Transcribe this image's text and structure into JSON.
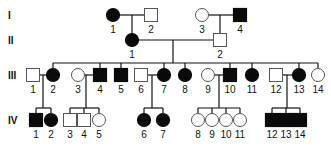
{
  "colors": {
    "affected": "#0a0a0a",
    "unaffected": "#ffffff",
    "line": "#111111"
  },
  "generations": [
    {
      "label": "I",
      "y": 15
    },
    {
      "label": "II",
      "y": 40
    },
    {
      "label": "III",
      "y": 75
    },
    {
      "label": "IV",
      "y": 120
    }
  ],
  "individuals": [
    {
      "id": "I-1",
      "gen": "I",
      "num": "1",
      "sex": "female",
      "affected": true,
      "x": 113,
      "y": 15
    },
    {
      "id": "I-2",
      "gen": "I",
      "num": "2",
      "sex": "male",
      "affected": false,
      "x": 151,
      "y": 15
    },
    {
      "id": "I-3",
      "gen": "I",
      "num": "3",
      "sex": "female",
      "affected": false,
      "x": 202,
      "y": 15
    },
    {
      "id": "I-4",
      "gen": "I",
      "num": "4",
      "sex": "male",
      "affected": true,
      "x": 240,
      "y": 15
    },
    {
      "id": "II-1",
      "gen": "II",
      "num": "1",
      "sex": "female",
      "affected": true,
      "x": 132,
      "y": 40
    },
    {
      "id": "II-2",
      "gen": "II",
      "num": "2",
      "sex": "male",
      "affected": false,
      "x": 220,
      "y": 40
    },
    {
      "id": "III-1",
      "gen": "III",
      "num": "1",
      "sex": "male",
      "affected": false,
      "x": 33,
      "y": 75
    },
    {
      "id": "III-2",
      "gen": "III",
      "num": "2",
      "sex": "female",
      "affected": true,
      "x": 53,
      "y": 75
    },
    {
      "id": "III-3",
      "gen": "III",
      "num": "3",
      "sex": "female",
      "affected": false,
      "x": 78,
      "y": 75
    },
    {
      "id": "III-4",
      "gen": "III",
      "num": "4",
      "sex": "male",
      "affected": true,
      "x": 100,
      "y": 75
    },
    {
      "id": "III-5",
      "gen": "III",
      "num": "5",
      "sex": "male",
      "affected": true,
      "x": 121,
      "y": 75
    },
    {
      "id": "III-6",
      "gen": "III",
      "num": "6",
      "sex": "male",
      "affected": false,
      "x": 141,
      "y": 75
    },
    {
      "id": "III-7",
      "gen": "III",
      "num": "7",
      "sex": "female",
      "affected": true,
      "x": 164,
      "y": 75
    },
    {
      "id": "III-8",
      "gen": "III",
      "num": "8",
      "sex": "female",
      "affected": true,
      "x": 185,
      "y": 75
    },
    {
      "id": "III-9",
      "gen": "III",
      "num": "9",
      "sex": "female",
      "affected": false,
      "x": 208,
      "y": 75
    },
    {
      "id": "III-10",
      "gen": "III",
      "num": "10",
      "sex": "male",
      "affected": true,
      "x": 230,
      "y": 75
    },
    {
      "id": "III-11",
      "gen": "III",
      "num": "11",
      "sex": "female",
      "affected": true,
      "x": 252,
      "y": 75
    },
    {
      "id": "III-12",
      "gen": "III",
      "num": "12",
      "sex": "male",
      "affected": false,
      "x": 276,
      "y": 75
    },
    {
      "id": "III-13",
      "gen": "III",
      "num": "13",
      "sex": "female",
      "affected": true,
      "x": 299,
      "y": 75
    },
    {
      "id": "III-14",
      "gen": "III",
      "num": "14",
      "sex": "female",
      "affected": false,
      "x": 318,
      "y": 75
    },
    {
      "id": "IV-1",
      "gen": "IV",
      "num": "1",
      "sex": "male",
      "affected": true,
      "x": 36,
      "y": 120
    },
    {
      "id": "IV-2",
      "gen": "IV",
      "num": "2",
      "sex": "female",
      "affected": true,
      "x": 51,
      "y": 120
    },
    {
      "id": "IV-3",
      "gen": "IV",
      "num": "3",
      "sex": "male",
      "affected": false,
      "x": 70,
      "y": 120
    },
    {
      "id": "IV-4",
      "gen": "IV",
      "num": "4",
      "sex": "male",
      "affected": false,
      "x": 84,
      "y": 120
    },
    {
      "id": "IV-5",
      "gen": "IV",
      "num": "5",
      "sex": "female",
      "affected": false,
      "x": 99,
      "y": 120
    },
    {
      "id": "IV-6",
      "gen": "IV",
      "num": "6",
      "sex": "female",
      "affected": true,
      "x": 144,
      "y": 120
    },
    {
      "id": "IV-7",
      "gen": "IV",
      "num": "7",
      "sex": "female",
      "affected": true,
      "x": 163,
      "y": 120
    },
    {
      "id": "IV-8",
      "gen": "IV",
      "num": "8",
      "sex": "female",
      "affected": false,
      "x": 198,
      "y": 120
    },
    {
      "id": "IV-9",
      "gen": "IV",
      "num": "9",
      "sex": "female",
      "affected": false,
      "x": 212,
      "y": 120
    },
    {
      "id": "IV-10",
      "gen": "IV",
      "num": "10",
      "sex": "female",
      "affected": false,
      "x": 226,
      "y": 120
    },
    {
      "id": "IV-11",
      "gen": "IV",
      "num": "11",
      "sex": "female",
      "affected": false,
      "x": 240,
      "y": 120
    },
    {
      "id": "IV-12",
      "gen": "IV",
      "num": "12",
      "sex": "male",
      "affected": true,
      "x": 272,
      "y": 120
    },
    {
      "id": "IV-13",
      "gen": "IV",
      "num": "13",
      "sex": "male",
      "affected": true,
      "x": 286,
      "y": 120
    },
    {
      "id": "IV-14",
      "gen": "IV",
      "num": "14",
      "sex": "male",
      "affected": true,
      "x": 300,
      "y": 120
    }
  ],
  "matings": [
    {
      "a": "I-1",
      "b": "I-2",
      "children": [
        "II-1"
      ],
      "dropX": 132
    },
    {
      "a": "I-3",
      "b": "I-4",
      "children": [
        "II-2"
      ],
      "dropX": 220
    },
    {
      "a": "II-1",
      "b": "II-2",
      "children": [
        "III-2",
        "III-4",
        "III-5",
        "III-7",
        "III-8",
        "III-10",
        "III-11",
        "III-13",
        "III-14"
      ],
      "dropX": 173
    },
    {
      "a": "III-1",
      "b": "III-2",
      "children": [
        "IV-1",
        "IV-2"
      ],
      "dropX": 43
    },
    {
      "a": "III-3",
      "b": "III-4",
      "children": [
        "IV-3",
        "IV-4",
        "IV-5"
      ],
      "dropX": 86
    },
    {
      "a": "III-6",
      "b": "III-7",
      "children": [
        "IV-6",
        "IV-7"
      ],
      "dropX": 152
    },
    {
      "a": "III-9",
      "b": "III-10",
      "children": [
        "IV-8",
        "IV-9",
        "IV-10",
        "IV-11"
      ],
      "dropX": 219
    },
    {
      "a": "III-12",
      "b": "III-13",
      "children": [
        "IV-12",
        "IV-13",
        "IV-14"
      ],
      "dropX": 287
    }
  ]
}
